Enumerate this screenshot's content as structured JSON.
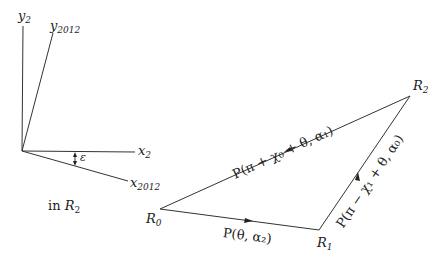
{
  "axes_frame": {
    "y_axis_label": "y",
    "y_axis_sub": "2",
    "y_rot_label": "y",
    "y_rot_sub": "2012",
    "x_axis_label": "x",
    "x_axis_sub": "2",
    "x_rot_label": "x",
    "x_rot_sub": "2012",
    "angle_label": "ε",
    "frame_caption_prefix": "in ",
    "frame_caption_var": "R",
    "frame_caption_sub": "2"
  },
  "triangle": {
    "vertices": [
      {
        "name": "R",
        "sub": "0"
      },
      {
        "name": "R",
        "sub": "1"
      },
      {
        "name": "R",
        "sub": "2"
      }
    ],
    "edges": {
      "r0_r1": "P(θ, α₂)",
      "r1_r2": "P(π − χ₁ + θ, α₀)",
      "r2_r0": "P(π + χ₀ + θ, α₁)"
    }
  },
  "colors": {
    "line": "#333333",
    "background": "#ffffff"
  }
}
